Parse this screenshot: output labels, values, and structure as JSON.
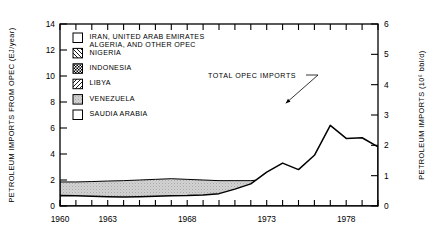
{
  "chart_data": {
    "type": "area",
    "stacked": true,
    "title": "",
    "xlabel": "",
    "ylabel": "PETROLEUM IMPORTS FROM OPEC (EJ/year)",
    "y2label": "PETROLEUM IMPORTS (10⁶ bbl/d)",
    "xlim": [
      1960,
      1980
    ],
    "ylim": [
      0,
      14
    ],
    "y2lim": [
      0,
      6
    ],
    "yticks": [
      0,
      2,
      4,
      6,
      8,
      10,
      12,
      14
    ],
    "ytick_labels": [
      "0",
      "2",
      "4",
      "6",
      "8",
      "10",
      "12",
      "14"
    ],
    "y2ticks": [
      0,
      1,
      2,
      3,
      4,
      5,
      6
    ],
    "y2tick_labels": [
      "0",
      "1",
      "2",
      "3",
      "4",
      "5",
      "6"
    ],
    "xticks": [
      1960,
      1961,
      1962,
      1963,
      1964,
      1965,
      1966,
      1967,
      1968,
      1969,
      1970,
      1971,
      1972,
      1973,
      1974,
      1975,
      1976,
      1977,
      1978,
      1979,
      1980
    ],
    "xtick_labels_shown": [
      {
        "x": 1960,
        "label": "1960"
      },
      {
        "x": 1963,
        "label": "1963"
      },
      {
        "x": 1968,
        "label": "1968"
      },
      {
        "x": 1973,
        "label": "1973"
      },
      {
        "x": 1978,
        "label": "1978"
      }
    ],
    "grid": false,
    "legend_position": "upper-left-inside",
    "annotations": [
      {
        "text": "TOTAL OPEC IMPORTS",
        "x": 1970.6,
        "y": 9.6,
        "leader_to_x": 1974.2,
        "leader_to_y": 7.9
      }
    ],
    "x": [
      1960,
      1961,
      1962,
      1963,
      1964,
      1965,
      1966,
      1967,
      1968,
      1969,
      1970,
      1971,
      1972,
      1973,
      1974,
      1975,
      1976,
      1977,
      1978,
      1979,
      1980
    ],
    "series": [
      {
        "name": "SAUDIA ARABIA",
        "pattern": "white",
        "values": [
          0.1,
          0.1,
          0.12,
          0.13,
          0.14,
          0.15,
          0.16,
          0.17,
          0.18,
          0.2,
          0.22,
          0.3,
          0.45,
          0.8,
          1.0,
          1.05,
          1.55,
          1.9,
          1.75,
          2.2,
          2.35
        ]
      },
      {
        "name": "VENEZUELA",
        "pattern": "stipple-gray",
        "values": [
          1.85,
          1.85,
          1.88,
          1.92,
          1.95,
          2.0,
          2.05,
          2.1,
          2.05,
          2.0,
          1.95,
          1.95,
          1.95,
          2.05,
          2.0,
          1.75,
          1.9,
          2.0,
          1.85,
          1.85,
          1.7
        ]
      },
      {
        "name": "LIBYA",
        "pattern": "hatch-forward",
        "values": [
          0.0,
          0.0,
          0.02,
          0.04,
          0.06,
          0.08,
          0.1,
          0.12,
          0.14,
          0.18,
          0.22,
          0.26,
          0.3,
          0.45,
          0.25,
          0.3,
          0.5,
          0.55,
          0.7,
          0.8,
          0.75
        ]
      },
      {
        "name": "INDONESIA",
        "pattern": "checker",
        "values": [
          0.05,
          0.05,
          0.06,
          0.07,
          0.08,
          0.1,
          0.12,
          0.14,
          0.2,
          0.26,
          0.32,
          0.4,
          0.5,
          0.65,
          0.7,
          0.75,
          0.95,
          1.05,
          1.0,
          1.1,
          1.05
        ]
      },
      {
        "name": "NIGERIA",
        "pattern": "hatch-back",
        "values": [
          0.0,
          0.0,
          0.0,
          0.01,
          0.02,
          0.04,
          0.06,
          0.1,
          0.15,
          0.25,
          0.38,
          0.55,
          0.75,
          1.1,
          1.3,
          1.15,
          1.9,
          2.1,
          1.75,
          2.1,
          2.0
        ]
      },
      {
        "name": "IRAN, UNITED ARAB EMIRATES ALGERIA, AND OTHER OPEC",
        "pattern": "white",
        "values": [
          0.8,
          0.78,
          0.75,
          0.72,
          0.7,
          0.72,
          0.75,
          0.78,
          0.8,
          0.85,
          0.95,
          1.3,
          1.7,
          2.6,
          3.3,
          2.8,
          3.9,
          6.2,
          5.2,
          5.25,
          4.55
        ]
      }
    ],
    "total_label": "TOTAL OPEC IMPORTS",
    "totals": [
      2.8,
      2.78,
      2.83,
      2.89,
      2.95,
      3.09,
      3.24,
      3.41,
      3.52,
      3.74,
      4.04,
      4.76,
      5.65,
      7.65,
      8.55,
      7.8,
      10.7,
      13.8,
      12.25,
      13.3,
      12.4
    ]
  },
  "legend": {
    "items": [
      {
        "label_line1": "IRAN, UNITED ARAB EMIRATES",
        "label_line2": "ALGERIA, AND OTHER OPEC",
        "pattern": "white"
      },
      {
        "label_line1": "NIGERIA",
        "label_line2": "",
        "pattern": "hatch-back"
      },
      {
        "label_line1": "INDONESIA",
        "label_line2": "",
        "pattern": "checker"
      },
      {
        "label_line1": "LIBYA",
        "label_line2": "",
        "pattern": "hatch-forward"
      },
      {
        "label_line1": "VENEZUELA",
        "label_line2": "",
        "pattern": "stipple-gray"
      },
      {
        "label_line1": "SAUDIA ARABIA",
        "label_line2": "",
        "pattern": "white"
      }
    ]
  },
  "colors": {
    "ink": "#000000",
    "background": "#ffffff",
    "stipple_gray": "#c9c9c9"
  }
}
